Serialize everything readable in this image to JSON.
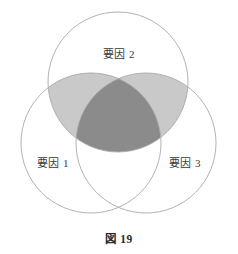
{
  "figure": {
    "caption": "図 19",
    "background_color": "#ffffff",
    "stroke_color": "#a9a9a9",
    "text_color": "#3a3a3a"
  },
  "diagram": {
    "type": "venn-3-circle",
    "radius": 70,
    "circles": [
      {
        "id": "factor1",
        "label": "要因 1",
        "cx": 91,
        "cy": 143,
        "r": 70,
        "label_x": 53,
        "label_y": 162
      },
      {
        "id": "factor2",
        "label": "要因 2",
        "cx": 118,
        "cy": 82,
        "r": 70,
        "label_x": 119,
        "label_y": 53
      },
      {
        "id": "factor3",
        "label": "要因 3",
        "cx": 146,
        "cy": 143,
        "r": 70,
        "label_x": 185,
        "label_y": 162
      }
    ],
    "shaded_regions": [
      {
        "id": "factor1-factor2",
        "fill": "#c9c9c9",
        "description": "overlap of 要因 1 and 要因 2"
      },
      {
        "id": "factor2-factor3",
        "fill": "#c9c9c9",
        "description": "overlap of 要因 2 and 要因 3"
      },
      {
        "id": "factor1-factor2-factor3",
        "fill": "#8b8b8b",
        "description": "overlap of all three factors"
      }
    ],
    "unshaded_regions": [
      {
        "id": "factor1-factor3",
        "fill": "#ffffff",
        "description": "overlap of 要因 1 and 要因 3 only"
      },
      {
        "id": "factor1-only",
        "fill": "#ffffff"
      },
      {
        "id": "factor2-only",
        "fill": "#ffffff"
      },
      {
        "id": "factor3-only",
        "fill": "#ffffff"
      }
    ],
    "colors": {
      "pair_shade": "#c9c9c9",
      "triple_shade": "#8b8b8b",
      "outline": "#a9a9a9",
      "page": "#ffffff"
    }
  }
}
